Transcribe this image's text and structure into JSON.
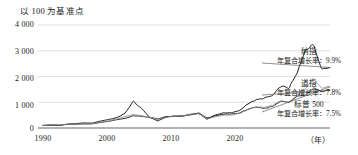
{
  "chart_data": {
    "type": "line",
    "title": "以 100 为基准点",
    "xlabel": "（年）",
    "ylabel": "",
    "xlim": [
      1988,
      2023
    ],
    "ylim": [
      0,
      4000
    ],
    "grid": true,
    "legend_position": "right-inline-annotations",
    "yticks": [
      "0",
      "1 000",
      "2 000",
      "3 000",
      "4 000"
    ],
    "ytick_values": [
      0,
      1000,
      2000,
      3000,
      4000
    ],
    "xticks": [
      "1990",
      "2000",
      "2010",
      "2020"
    ],
    "xtick_values": [
      1990,
      2000,
      2010,
      2020
    ],
    "x": [
      1988,
      1989,
      1990,
      1991,
      1992,
      1993,
      1994,
      1995,
      1996,
      1997,
      1998,
      1999,
      2000,
      2001,
      2002,
      2003,
      2004,
      2005,
      2006,
      2007,
      2008,
      2009,
      2010,
      2011,
      2012,
      2013,
      2014,
      2015,
      2016,
      2017,
      2018,
      2019,
      2020,
      2021,
      2022,
      2023
    ],
    "series": [
      {
        "name": "纳指",
        "cagr": "9.9%",
        "label": "纳指",
        "cagr_label": "年复合增长率：9.9%",
        "color": "#1c1c1c",
        "values": [
          100,
          110,
          100,
          150,
          170,
          195,
          190,
          270,
          330,
          400,
          570,
          1030,
          760,
          420,
          275,
          420,
          455,
          470,
          520,
          580,
          345,
          500,
          590,
          590,
          680,
          950,
          1090,
          1160,
          1260,
          1620,
          1560,
          2130,
          3060,
          3220,
          2300,
          2350
        ]
      },
      {
        "name": "道指",
        "cagr": "7.8%",
        "label": "道指",
        "cagr_label": "年复合增长率：7.8%",
        "color": "#2c2c2c",
        "values": [
          100,
          118,
          112,
          140,
          148,
          160,
          160,
          215,
          260,
          320,
          375,
          470,
          450,
          415,
          350,
          440,
          460,
          455,
          520,
          560,
          390,
          470,
          535,
          545,
          585,
          735,
          800,
          760,
          840,
          1050,
          990,
          1230,
          1290,
          1560,
          1420,
          1470
        ]
      },
      {
        "name": "标普 500",
        "cagr": "7.5%",
        "label": "标普 500",
        "cagr_label": "年复合增长率：7.5%",
        "color": "#8c8c8c",
        "values": [
          100,
          122,
          116,
          148,
          156,
          168,
          168,
          225,
          270,
          350,
          445,
          530,
          480,
          420,
          325,
          415,
          455,
          470,
          535,
          560,
          350,
          435,
          495,
          500,
          565,
          730,
          815,
          810,
          890,
          1060,
          1000,
          1290,
          1510,
          1900,
          1540,
          1600
        ]
      }
    ]
  },
  "annotations": {
    "nasdaq": {
      "name": "纳指",
      "cagr": "年复合增长率：9.9%"
    },
    "dow": {
      "name": "道指",
      "cagr": "年复合增长率：7.8%"
    },
    "sp500": {
      "name": "标普 500",
      "cagr": "年复合增长率：7.5%"
    }
  }
}
